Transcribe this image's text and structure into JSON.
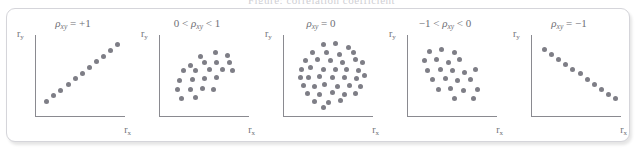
{
  "caption_cut": "Figure: correlation coefficient",
  "figure": {
    "border_color": "#d5d5da",
    "axis_color": "#8a8a90",
    "dot_color": "#7e7e86",
    "label_color": "#6f6f76"
  },
  "axis_labels": {
    "x_base": "r",
    "x_sub": "x",
    "y_base": "r",
    "y_sub": "y"
  },
  "chart_data": [
    {
      "type": "scatter",
      "title": "ρxy = +1",
      "title_parts": {
        "pre": "",
        "rho": "ρ",
        "sub": "xy",
        "post": " = +1"
      },
      "xlabel": "rx",
      "ylabel": "ry",
      "xlim": [
        0,
        100
      ],
      "ylim": [
        0,
        100
      ],
      "grid": false,
      "n_points": 11,
      "rho": 1,
      "points": [
        [
          12,
          18
        ],
        [
          20,
          25
        ],
        [
          28,
          32
        ],
        [
          36,
          39
        ],
        [
          44,
          46
        ],
        [
          52,
          53
        ],
        [
          60,
          60
        ],
        [
          68,
          67
        ],
        [
          76,
          74
        ],
        [
          84,
          81
        ],
        [
          92,
          88
        ]
      ]
    },
    {
      "type": "scatter",
      "title": "0 < ρxy < 1",
      "title_parts": {
        "pre": "0 < ",
        "rho": "ρ",
        "sub": "xy",
        "post": " < 1"
      },
      "xlabel": "rx",
      "ylabel": "ry",
      "xlim": [
        0,
        100
      ],
      "ylim": [
        0,
        100
      ],
      "grid": false,
      "n_points": 21,
      "rho": 0.75,
      "points": [
        [
          46,
          74
        ],
        [
          62,
          78
        ],
        [
          76,
          75
        ],
        [
          34,
          62
        ],
        [
          50,
          66
        ],
        [
          64,
          66
        ],
        [
          78,
          66
        ],
        [
          26,
          56
        ],
        [
          40,
          56
        ],
        [
          56,
          58
        ],
        [
          70,
          58
        ],
        [
          82,
          56
        ],
        [
          22,
          44
        ],
        [
          36,
          45
        ],
        [
          50,
          46
        ],
        [
          64,
          47
        ],
        [
          20,
          33
        ],
        [
          34,
          33
        ],
        [
          48,
          34
        ],
        [
          60,
          33
        ],
        [
          24,
          22
        ],
        [
          40,
          23
        ]
      ]
    },
    {
      "type": "scatter",
      "title": "ρxy = 0",
      "title_parts": {
        "pre": "",
        "rho": "ρ",
        "sub": "xy",
        "post": " = 0"
      },
      "xlabel": "rx",
      "ylabel": "ry",
      "xlim": [
        0,
        100
      ],
      "ylim": [
        0,
        100
      ],
      "grid": false,
      "n_points": 41,
      "rho": 0,
      "points": [
        [
          44,
          88
        ],
        [
          58,
          90
        ],
        [
          72,
          85
        ],
        [
          32,
          78
        ],
        [
          48,
          79
        ],
        [
          62,
          76
        ],
        [
          78,
          78
        ],
        [
          24,
          68
        ],
        [
          38,
          70
        ],
        [
          52,
          68
        ],
        [
          66,
          66
        ],
        [
          80,
          70
        ],
        [
          88,
          66
        ],
        [
          20,
          58
        ],
        [
          30,
          60
        ],
        [
          44,
          58
        ],
        [
          58,
          57
        ],
        [
          70,
          58
        ],
        [
          84,
          56
        ],
        [
          18,
          48
        ],
        [
          28,
          47
        ],
        [
          40,
          49
        ],
        [
          54,
          47
        ],
        [
          68,
          48
        ],
        [
          82,
          46
        ],
        [
          90,
          50
        ],
        [
          22,
          38
        ],
        [
          34,
          37
        ],
        [
          46,
          39
        ],
        [
          60,
          36
        ],
        [
          74,
          38
        ],
        [
          86,
          36
        ],
        [
          26,
          28
        ],
        [
          40,
          27
        ],
        [
          54,
          29
        ],
        [
          68,
          27
        ],
        [
          80,
          28
        ],
        [
          34,
          18
        ],
        [
          50,
          17
        ],
        [
          64,
          19
        ],
        [
          44,
          10
        ]
      ]
    },
    {
      "type": "scatter",
      "title": "-1 < ρxy < 0",
      "title_parts": {
        "pre": "−1 < ",
        "rho": "ρ",
        "sub": "xy",
        "post": " < 0"
      },
      "xlabel": "rx",
      "ylabel": "ry",
      "xlim": [
        0,
        100
      ],
      "ylim": [
        0,
        100
      ],
      "grid": false,
      "n_points": 21,
      "rho": -0.75,
      "points": [
        [
          24,
          80
        ],
        [
          38,
          82
        ],
        [
          52,
          78
        ],
        [
          18,
          68
        ],
        [
          32,
          70
        ],
        [
          46,
          66
        ],
        [
          58,
          70
        ],
        [
          22,
          56
        ],
        [
          36,
          58
        ],
        [
          50,
          56
        ],
        [
          64,
          54
        ],
        [
          76,
          57
        ],
        [
          28,
          45
        ],
        [
          42,
          46
        ],
        [
          56,
          44
        ],
        [
          70,
          45
        ],
        [
          34,
          33
        ],
        [
          48,
          34
        ],
        [
          62,
          32
        ],
        [
          78,
          33
        ],
        [
          52,
          22
        ],
        [
          74,
          21
        ]
      ]
    },
    {
      "type": "scatter",
      "title": "ρxy = -1",
      "title_parts": {
        "pre": "",
        "rho": "ρ",
        "sub": "xy",
        "post": " = −1"
      },
      "xlabel": "rx",
      "ylabel": "ry",
      "xlim": [
        0,
        100
      ],
      "ylim": [
        0,
        100
      ],
      "grid": false,
      "n_points": 11,
      "rho": -1,
      "points": [
        [
          14,
          82
        ],
        [
          22,
          76
        ],
        [
          30,
          70
        ],
        [
          38,
          64
        ],
        [
          46,
          58
        ],
        [
          54,
          52
        ],
        [
          62,
          45
        ],
        [
          70,
          39
        ],
        [
          78,
          33
        ],
        [
          86,
          27
        ],
        [
          94,
          21
        ]
      ]
    }
  ]
}
